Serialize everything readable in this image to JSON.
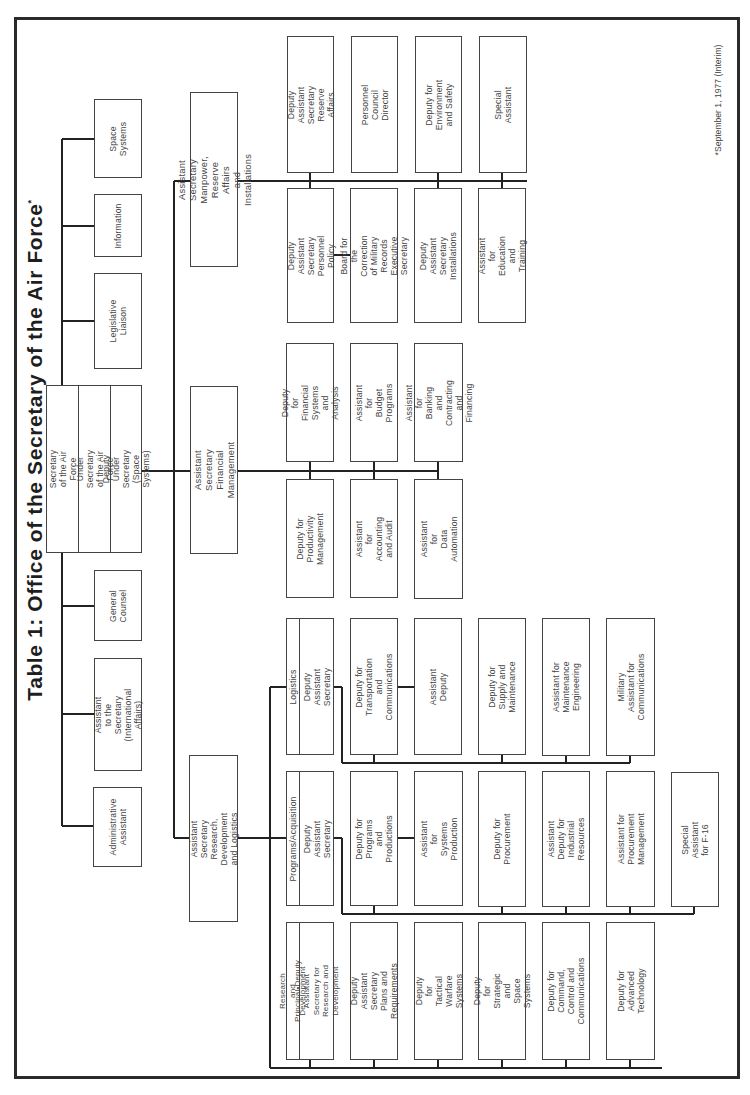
{
  "title": {
    "text": "Table 1: Office of the Secretary of the Air Force",
    "mark": "*"
  },
  "footnote": "*September 1, 1977 (Interim)",
  "secretariat": {
    "secretary": "Secretary of the Air Force",
    "under_secretary": "Under Secretary of the Air Force",
    "deputy_under_secretary": "Deputy Under Secretary\n(Space Systems)"
  },
  "staff_offices": [
    {
      "id": "space-systems",
      "label": "Space Systems"
    },
    {
      "id": "information",
      "label": "Information"
    },
    {
      "id": "legislative-liaison",
      "label": "Legislative Liaison"
    },
    {
      "id": "general-counsel",
      "label": "General\nCounsel"
    },
    {
      "id": "international-affairs",
      "label": "Assistant\nto the Secretary\n(International Affairs)"
    },
    {
      "id": "administrative-assistant",
      "label": "Administrative\nAssistant"
    }
  ],
  "manpower": {
    "head": "Assistant Secretary\nManpower, Reserve Affairs\nand Installations",
    "upper": [
      "Deputy Assistant Secretary\nReserve Affairs",
      "Personnel Council\nDirector",
      "Deputy for\nEnvironment and Safety",
      "Special Assistant"
    ],
    "lower": [
      "Deputy Assistant Secretary\nPersonnel Policy",
      "Board for the Correction\nof Military Records\nExecutive Secretary",
      "Deputy Assistant Secretary\nInstallations",
      "Assistant for\nEducation and Training"
    ]
  },
  "financial": {
    "head": "Assistant Secretary\nFinancial Management",
    "upper": [
      "Deputy for Financial\nSystems and\nAnalysis",
      "Assistant for\nBudget Programs",
      "Assistant for\nBanking and\nContracting\nand Financing"
    ],
    "lower": [
      "Deputy for\nProductivity\nManagement",
      "Assistant for\nAccounting and Audit",
      "Assistant for\nData Automation"
    ]
  },
  "rdl": {
    "head": "Assistant Secretary\nResearch, Development\nand Logistics",
    "logistics": {
      "tag": "Logistics",
      "head": "Deputy Assistant Secretary",
      "items": [
        "Deputy for Transportation\nand Communications",
        "Assistant Deputy",
        "Deputy for\nSupply and Maintenance",
        "Assistant for\nMaintenance Engineering",
        "Military Assistant for\nCommunications"
      ]
    },
    "programs": {
      "tag": "Programs/Acquisition",
      "head": "Deputy Assistant Secretary",
      "items": [
        "Deputy for Programs\nand Productions",
        "Assistant for Systems\nProduction",
        "Deputy for Procurement",
        "Assistant Deputy for\nIndustrial Resources",
        "Assistant for\nProcurement Management",
        "Special Assistant for F-16"
      ]
    },
    "research": {
      "tag": "Research and Development",
      "head": "Principal•Deputy\nAssistant Secretary for\nResearch and Development",
      "items": [
        "Deputy Assistant Secretary\nPlans and Requirements",
        "Deputy for\nTactical Warfare Systems",
        "Deputy for\nStrategic and Space Systems",
        "Deputy for\nCommand, Control and\nCommunications",
        "Deputy for\nAdvanced Technology"
      ]
    }
  }
}
